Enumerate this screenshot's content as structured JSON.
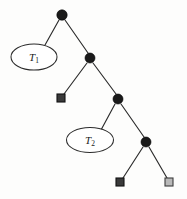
{
  "diagram": {
    "kind": "binary-tree",
    "colors": {
      "background": "#fdfdfc",
      "edge": "#2b2b2b",
      "internal_node": "#1a1a1a",
      "leaf_filled": "#3a3a3a",
      "leaf_open": "#b9b9b9",
      "label_text": "#1a1a1a"
    },
    "internal_nodes": [
      {
        "id": "n1",
        "role": "root",
        "x": 62,
        "y": 15,
        "r": 5.2
      },
      {
        "id": "n2",
        "role": "internal",
        "x": 90,
        "y": 58,
        "r": 5.0
      },
      {
        "id": "n3",
        "role": "internal",
        "x": 118,
        "y": 99,
        "r": 5.0
      },
      {
        "id": "n4",
        "role": "internal",
        "x": 146,
        "y": 142,
        "r": 5.0
      }
    ],
    "subtrees": [
      {
        "id": "t1",
        "label_base": "T",
        "label_sub": "1",
        "cx": 34,
        "cy": 57,
        "rx": 23,
        "ry": 13
      },
      {
        "id": "t2",
        "label_base": "T",
        "label_sub": "2",
        "cx": 90,
        "cy": 140,
        "rx": 23.5,
        "ry": 12.5
      }
    ],
    "leaves": [
      {
        "id": "l1",
        "style": "filled",
        "x": 61,
        "y": 98,
        "size": 8
      },
      {
        "id": "l2",
        "style": "filled",
        "x": 120,
        "y": 182,
        "size": 8
      },
      {
        "id": "l3",
        "style": "open",
        "x": 169,
        "y": 182,
        "size": 8
      }
    ],
    "edges": [
      {
        "id": "e1",
        "from": "n1",
        "to": "t1",
        "x1": 59,
        "y1": 20,
        "x2": 45,
        "y2": 45
      },
      {
        "id": "e2",
        "from": "n1",
        "to": "n2",
        "x1": 65,
        "y1": 20,
        "x2": 88,
        "y2": 53
      },
      {
        "id": "e3",
        "from": "n2",
        "to": "l1",
        "x1": 87,
        "y1": 63,
        "x2": 64,
        "y2": 94
      },
      {
        "id": "e4",
        "from": "n2",
        "to": "n3",
        "x1": 93,
        "y1": 63,
        "x2": 116,
        "y2": 94
      },
      {
        "id": "e5",
        "from": "n3",
        "to": "t2",
        "x1": 115,
        "y1": 104,
        "x2": 101,
        "y2": 130
      },
      {
        "id": "e6",
        "from": "n3",
        "to": "n4",
        "x1": 121,
        "y1": 104,
        "x2": 144,
        "y2": 137
      },
      {
        "id": "e7",
        "from": "n4",
        "to": "l2",
        "x1": 143,
        "y1": 147,
        "x2": 123,
        "y2": 178
      },
      {
        "id": "e8",
        "from": "n4",
        "to": "l3",
        "x1": 149,
        "y1": 147,
        "x2": 167,
        "y2": 178
      }
    ]
  }
}
